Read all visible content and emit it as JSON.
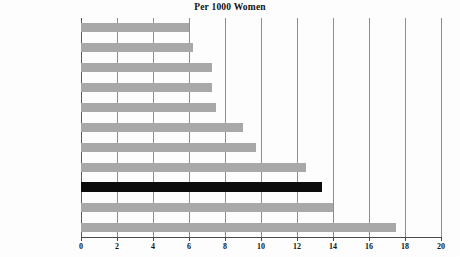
{
  "chart_data": {
    "type": "bar",
    "orientation": "horizontal",
    "title": "Per 1000 Women",
    "xlabel": "",
    "ylabel": "",
    "xlim": [
      0,
      20
    ],
    "xticks": [
      0,
      2,
      4,
      6,
      8,
      10,
      12,
      14,
      16,
      18,
      20
    ],
    "grid": true,
    "legend": "none",
    "categories": [
      "Ireland",
      "Belgium",
      "Netherlands",
      "Spain",
      "Germany",
      "Finland",
      "Italy",
      "Denmark",
      "United States",
      "United Kingdom",
      "Sweden"
    ],
    "values": [
      6.0,
      6.2,
      7.3,
      7.3,
      7.5,
      9.0,
      9.7,
      12.5,
      13.4,
      14.0,
      17.5
    ],
    "highlight_category": "United States",
    "colors": {
      "bar": "#a8a8a8",
      "bar_highlight": "#0b0b0b",
      "gridline": "#8e8e8e",
      "axis": "#4a4a4a",
      "text": "#16120f",
      "background": "#fdfdfd"
    }
  }
}
